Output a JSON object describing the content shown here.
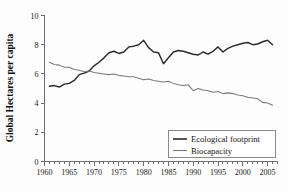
{
  "chart_data": {
    "type": "line",
    "title": "",
    "xlabel": "",
    "ylabel": "Global Hectares per capita",
    "xlim": [
      1960,
      2007
    ],
    "ylim": [
      0,
      10
    ],
    "grid": false,
    "legend_position": "bottom-right",
    "x_ticks_major": [
      1960,
      1965,
      1970,
      1975,
      1980,
      1985,
      1990,
      1995,
      2000,
      2005
    ],
    "x_tick_labels": [
      "1960",
      "1965",
      "1970",
      "1975",
      "1980",
      "1985",
      "1990",
      "1995",
      "2000",
      "2005"
    ],
    "x_minor_tick_step": 1,
    "y_ticks": [
      0,
      2,
      4,
      6,
      8,
      10
    ],
    "y_tick_labels": [
      "0",
      "2",
      "4",
      "6",
      "8",
      "10"
    ],
    "x": [
      1961,
      1962,
      1963,
      1964,
      1965,
      1966,
      1967,
      1968,
      1969,
      1970,
      1971,
      1972,
      1973,
      1974,
      1975,
      1976,
      1977,
      1978,
      1979,
      1980,
      1981,
      1982,
      1983,
      1984,
      1985,
      1986,
      1987,
      1988,
      1989,
      1990,
      1991,
      1992,
      1993,
      1994,
      1995,
      1996,
      1997,
      1998,
      1999,
      2000,
      2001,
      2002,
      2003,
      2004,
      2005,
      2006
    ],
    "series": [
      {
        "name": "Ecological footprint",
        "color": "#2b2b2b",
        "values": [
          5.15,
          5.2,
          5.1,
          5.3,
          5.35,
          5.55,
          5.95,
          6.05,
          6.2,
          6.55,
          6.8,
          7.1,
          7.45,
          7.55,
          7.4,
          7.5,
          7.85,
          7.9,
          8.0,
          8.3,
          7.8,
          7.5,
          7.45,
          6.7,
          7.1,
          7.5,
          7.6,
          7.55,
          7.45,
          7.35,
          7.3,
          7.5,
          7.35,
          7.55,
          7.85,
          7.5,
          7.75,
          7.9,
          8.0,
          8.1,
          8.15,
          8.0,
          8.05,
          8.2,
          8.3,
          8.0
        ]
      },
      {
        "name": "Biocapacity",
        "color": "#7a7a7a",
        "values": [
          6.8,
          6.65,
          6.6,
          6.45,
          6.45,
          6.3,
          6.25,
          6.15,
          6.2,
          6.1,
          6.05,
          6.0,
          5.95,
          6.0,
          5.9,
          5.85,
          5.8,
          5.8,
          5.7,
          5.6,
          5.65,
          5.55,
          5.5,
          5.45,
          5.5,
          5.35,
          5.25,
          5.2,
          5.25,
          4.85,
          5.0,
          4.9,
          4.85,
          4.75,
          4.8,
          4.65,
          4.7,
          4.65,
          4.55,
          4.5,
          4.4,
          4.35,
          4.3,
          4.05,
          4.0,
          3.85
        ]
      }
    ]
  },
  "legend": {
    "items": [
      {
        "label": "Ecological footprint"
      },
      {
        "label": "Biocapacity"
      }
    ]
  }
}
